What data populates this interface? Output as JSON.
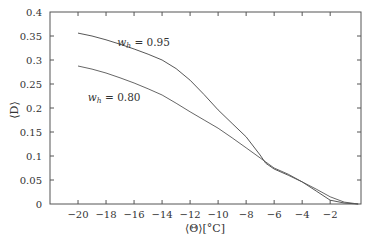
{
  "chart_data": {
    "type": "line",
    "title": "",
    "xlabel": "⟨Θ⟩[°C]",
    "ylabel": "⟨D⟩",
    "xlim": [
      -22,
      0.2
    ],
    "ylim": [
      0,
      0.4
    ],
    "grid": false,
    "legend": "inline annotations",
    "xticks": [
      -20,
      -18,
      -16,
      -14,
      -12,
      -10,
      -8,
      -6,
      -4,
      -2
    ],
    "xtick_labels": [
      "−20",
      "−18",
      "−16",
      "−14",
      "−12",
      "−10",
      "−8",
      "−6",
      "−4",
      "−2"
    ],
    "yticks": [
      0,
      0.05,
      0.1,
      0.15,
      0.2,
      0.25,
      0.3,
      0.35,
      0.4
    ],
    "ytick_labels": [
      "0",
      "0.05",
      "0.1",
      "0.15",
      "0.2",
      "0.25",
      "0.3",
      "0.35",
      "0.4"
    ],
    "series": [
      {
        "name": "w_h = 0.95",
        "label_main": "w",
        "label_sub": "h",
        "label_rest": " = 0.95",
        "color": "#444444",
        "x": [
          -20,
          -19,
          -18,
          -17,
          -16,
          -15,
          -14,
          -13,
          -12,
          -11,
          -10,
          -9,
          -8,
          -7,
          -6.6,
          -6,
          -5,
          -4,
          -3,
          -2,
          -1,
          0
        ],
        "y": [
          0.356,
          0.35,
          0.342,
          0.333,
          0.323,
          0.312,
          0.3,
          0.282,
          0.258,
          0.228,
          0.196,
          0.168,
          0.14,
          0.102,
          0.085,
          0.073,
          0.06,
          0.046,
          0.027,
          0.008,
          0.002,
          0.0
        ]
      },
      {
        "name": "w_h = 0.80",
        "label_main": "w",
        "label_sub": "h",
        "label_rest": " = 0.80",
        "color": "#555555",
        "x": [
          -20,
          -19,
          -18,
          -17,
          -16,
          -15,
          -14,
          -13,
          -12,
          -11,
          -10,
          -9,
          -8,
          -7,
          -6,
          -5,
          -4,
          -3,
          -2,
          -1,
          0
        ],
        "y": [
          0.2875,
          0.281,
          0.273,
          0.263,
          0.252,
          0.24,
          0.227,
          0.21,
          0.192,
          0.175,
          0.158,
          0.138,
          0.117,
          0.096,
          0.075,
          0.062,
          0.046,
          0.031,
          0.015,
          0.004,
          0.0
        ]
      }
    ],
    "annotations": [
      {
        "text": "w_h = 0.95",
        "x": -17.2,
        "y": 0.33
      },
      {
        "text": "w_h = 0.80",
        "x": -19.3,
        "y": 0.215
      }
    ]
  }
}
